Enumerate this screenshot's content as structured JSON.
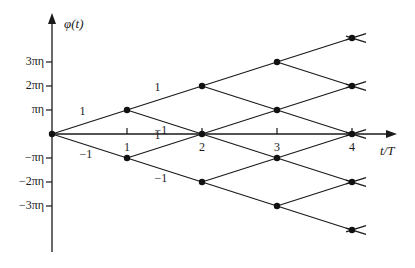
{
  "diagram": {
    "y_axis_label": "φ(t)",
    "x_axis_label": "t/T",
    "y_ticks": [
      {
        "label": "3πη",
        "level": 3
      },
      {
        "label": "2πη",
        "level": 2
      },
      {
        "label": "πη",
        "level": 1
      },
      {
        "label": "−πη",
        "level": -1
      },
      {
        "label": "−2πη",
        "level": -2
      },
      {
        "label": "−3πη",
        "level": -3
      }
    ],
    "x_ticks": [
      {
        "label": "1",
        "t": 1
      },
      {
        "label": "2",
        "t": 2
      },
      {
        "label": "3",
        "t": 3
      },
      {
        "label": "4",
        "t": 4
      }
    ],
    "branch_labels": [
      {
        "label": "1",
        "from": [
          0,
          0
        ],
        "to": [
          1,
          1
        ]
      },
      {
        "label": "−1",
        "from": [
          0,
          0
        ],
        "to": [
          1,
          -1
        ]
      },
      {
        "label": "1",
        "from": [
          1,
          1
        ],
        "to": [
          2,
          2
        ]
      },
      {
        "label": "−1",
        "from": [
          1,
          1
        ],
        "to": [
          2,
          0
        ]
      },
      {
        "label": "1",
        "from": [
          1,
          -1
        ],
        "to": [
          2,
          0
        ]
      },
      {
        "label": "−1",
        "from": [
          1,
          -1
        ],
        "to": [
          2,
          -2
        ]
      }
    ],
    "colors": {
      "line": "#1a1a1a",
      "node": "#111111",
      "background": "#ffffff"
    }
  },
  "chart_data": {
    "type": "trellis",
    "title": "",
    "xlabel": "t/T",
    "ylabel": "φ(t)",
    "x_ticks": [
      1,
      2,
      3,
      4
    ],
    "y_ticks": [
      "-3πη",
      "-2πη",
      "-πη",
      "πη",
      "2πη",
      "3πη"
    ],
    "nodes": [
      [
        0,
        0
      ],
      [
        1,
        1
      ],
      [
        1,
        -1
      ],
      [
        2,
        2
      ],
      [
        2,
        0
      ],
      [
        2,
        -2
      ],
      [
        3,
        3
      ],
      [
        3,
        1
      ],
      [
        3,
        -1
      ],
      [
        3,
        -3
      ],
      [
        4,
        4
      ],
      [
        4,
        2
      ],
      [
        4,
        0
      ],
      [
        4,
        -2
      ],
      [
        4,
        -4
      ]
    ],
    "transitions": "each node at (t, k) connects to (t+1, k+1) for symbol 1 and (t+1, k-1) for symbol −1"
  }
}
